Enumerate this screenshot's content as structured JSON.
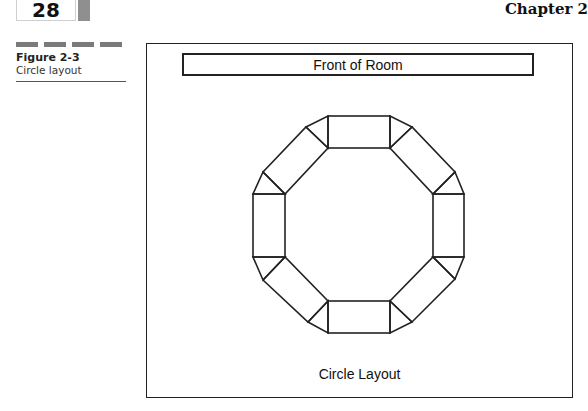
{
  "header": {
    "page_number": "28",
    "chapter": "Chapter 2"
  },
  "figure": {
    "label": "Figure 2-3",
    "caption": "Circle layout"
  },
  "diagram": {
    "front_label": "Front of Room",
    "title": "Circle Layout",
    "table_count": 8,
    "stroke_color": "#222222"
  }
}
